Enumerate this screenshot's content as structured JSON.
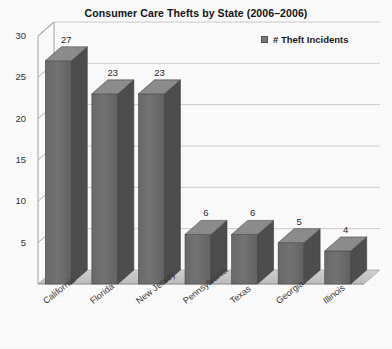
{
  "chart_data": {
    "type": "bar",
    "title": "Consumer Care Thefts by State (2006–2006)",
    "xlabel": "",
    "ylabel": "",
    "categories": [
      "California",
      "Florida",
      "New Jersey",
      "Pennsylvania",
      "Texas",
      "Georgia",
      "Illinois"
    ],
    "values": [
      27,
      23,
      23,
      6,
      6,
      5,
      4
    ],
    "series": [
      {
        "name": "# Theft Incidents",
        "values": [
          27,
          23,
          23,
          6,
          6,
          5,
          4
        ]
      }
    ],
    "value_labels": [
      "27",
      "23",
      "23",
      "6",
      "6",
      "5",
      "4"
    ],
    "ylim": [
      0,
      30
    ],
    "ytick_values": [
      5,
      10,
      15,
      20,
      25,
      30
    ],
    "ytick_labels": [
      "5",
      "10",
      "15",
      "20",
      "25",
      "30"
    ],
    "grid": true,
    "grid_axis": "y",
    "legend": {
      "position": "top-right",
      "entries": [
        "# Theft Incidents"
      ]
    },
    "style": {
      "three_d": true,
      "bar_front_color": "#6f6f6f",
      "bar_side_color": "#4e4e4e",
      "bar_top_color": "#8d8d8d",
      "floor_color": "#c9c9c9",
      "grid_color": "#c0c0c0",
      "axis_color": "#9a9a9a",
      "background_color": "#fdfdfd",
      "title_color": "#141414",
      "label_color": "#3a3a3a"
    }
  },
  "legend": {
    "label": "# Theft Incidents",
    "swatch_name": "legend-swatch-theft-incidents"
  },
  "axis": {
    "y_ticks": [
      "30",
      "25",
      "20",
      "15",
      "10",
      "5"
    ]
  }
}
